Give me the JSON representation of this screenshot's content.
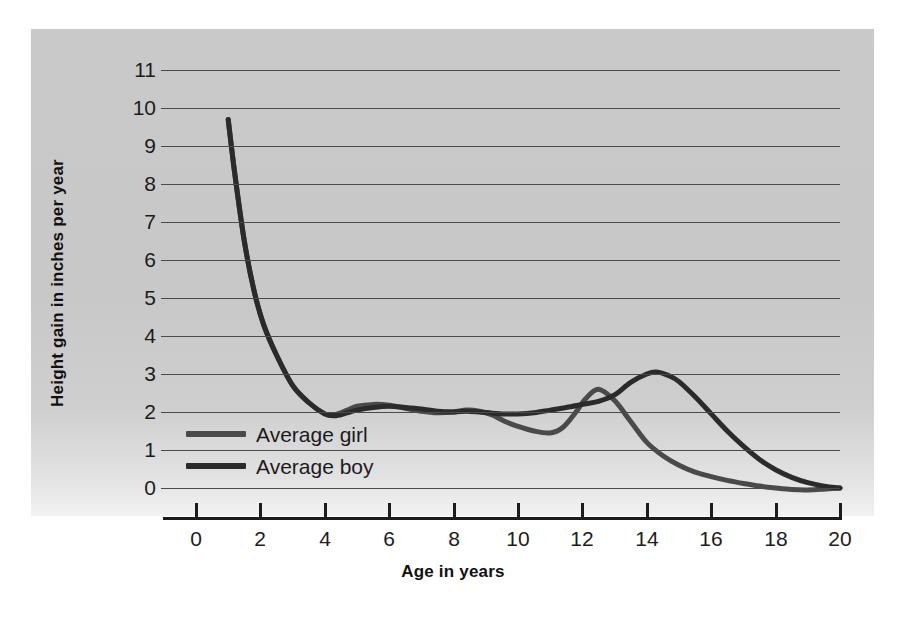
{
  "figure": {
    "background_color": "#ffffff",
    "panel_color": "#c8c8c8",
    "gridline_color": "#4b4b4b",
    "axis_color": "#1c1c1c"
  },
  "chart_data": {
    "type": "line",
    "title": "",
    "xlabel": "Age in years",
    "ylabel": "Height gain in inches per year",
    "xlim": [
      0,
      20
    ],
    "ylim": [
      0,
      11
    ],
    "grid": true,
    "grid_axis": "y",
    "legend_position": "inside-lower-left",
    "x_ticks": [
      0,
      2,
      4,
      6,
      8,
      10,
      12,
      14,
      16,
      18,
      20
    ],
    "x_tick_labels": [
      "0",
      "2",
      "4",
      "6",
      "8",
      "10",
      "12",
      "14",
      "16",
      "18",
      "20"
    ],
    "y_ticks": [
      0,
      1,
      2,
      3,
      4,
      5,
      6,
      7,
      8,
      9,
      10,
      11
    ],
    "y_tick_labels": [
      "0",
      "1",
      "2",
      "3",
      "4",
      "5",
      "6",
      "7",
      "8",
      "9",
      "10",
      "11"
    ],
    "series": [
      {
        "name": "Average girl",
        "color": "#4a4a4a",
        "line_width": 5,
        "x": [
          1.0,
          1.2,
          1.5,
          1.8,
          2.1,
          2.5,
          3.0,
          3.5,
          4.0,
          4.3,
          4.7,
          5.0,
          5.5,
          6.0,
          6.5,
          7.0,
          7.5,
          8.0,
          8.4,
          8.8,
          9.2,
          9.6,
          10.0,
          10.5,
          11.0,
          11.4,
          11.8,
          12.1,
          12.5,
          13.0,
          13.5,
          14.0,
          14.5,
          15.0,
          15.5,
          16.0,
          16.5,
          17.0,
          17.5,
          18.0,
          18.5,
          19.0,
          19.5,
          20.0
        ],
        "y": [
          9.7,
          8.3,
          6.5,
          5.2,
          4.3,
          3.5,
          2.7,
          2.25,
          1.95,
          1.93,
          2.05,
          2.15,
          2.2,
          2.18,
          2.1,
          2.02,
          1.98,
          2.0,
          2.05,
          2.02,
          1.92,
          1.75,
          1.62,
          1.5,
          1.45,
          1.6,
          2.0,
          2.35,
          2.6,
          2.3,
          1.75,
          1.2,
          0.85,
          0.6,
          0.42,
          0.3,
          0.2,
          0.12,
          0.05,
          0.0,
          -0.04,
          -0.05,
          -0.03,
          0.0
        ]
      },
      {
        "name": "Average boy",
        "color": "#2b2b2b",
        "line_width": 5,
        "x": [
          1.0,
          1.2,
          1.5,
          1.8,
          2.1,
          2.5,
          3.0,
          3.5,
          4.0,
          4.3,
          4.7,
          5.0,
          5.5,
          6.0,
          6.5,
          7.0,
          7.5,
          8.0,
          8.4,
          8.8,
          9.2,
          9.6,
          10.0,
          10.5,
          11.0,
          11.5,
          12.0,
          12.5,
          13.0,
          13.5,
          14.0,
          14.3,
          14.7,
          15.0,
          15.5,
          16.0,
          16.5,
          17.0,
          17.5,
          18.0,
          18.5,
          19.0,
          19.5,
          20.0
        ],
        "y": [
          9.7,
          8.3,
          6.5,
          5.2,
          4.3,
          3.5,
          2.7,
          2.25,
          1.95,
          1.9,
          1.98,
          2.05,
          2.12,
          2.15,
          2.12,
          2.08,
          2.02,
          2.0,
          2.02,
          2.0,
          1.97,
          1.95,
          1.95,
          1.98,
          2.05,
          2.12,
          2.2,
          2.28,
          2.45,
          2.78,
          3.0,
          3.05,
          2.95,
          2.8,
          2.4,
          1.95,
          1.5,
          1.1,
          0.75,
          0.48,
          0.28,
          0.14,
          0.05,
          0.0
        ]
      }
    ],
    "annotations": [
      {
        "text": "Average girl",
        "kind": "legend-entry"
      },
      {
        "text": "Average boy",
        "kind": "legend-entry"
      }
    ]
  },
  "legend": {
    "entries": [
      {
        "label": "Average girl",
        "color": "#4a4a4a"
      },
      {
        "label": "Average boy",
        "color": "#2b2b2b"
      }
    ]
  }
}
